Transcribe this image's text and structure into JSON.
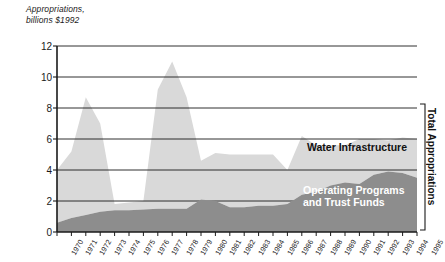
{
  "chart_data": {
    "type": "area",
    "stacked": true,
    "title": "Appropriations,\nbillions $1992",
    "xlabel": "",
    "ylabel": "Appropriations, billions $1992",
    "ylim": [
      0,
      12
    ],
    "yticks": [
      0,
      2,
      4,
      6,
      8,
      10,
      12
    ],
    "grid": true,
    "grid_axis": "y",
    "legend_position": "inline-annotation",
    "x": [
      1970,
      1971,
      1972,
      1973,
      1974,
      1975,
      1976,
      1977,
      1978,
      1979,
      1980,
      1981,
      1982,
      1983,
      1984,
      1985,
      1986,
      1987,
      1988,
      1989,
      1990,
      1991,
      1992,
      1993,
      1994,
      1995
    ],
    "categories": [
      "1970",
      "1971",
      "1972",
      "1973",
      "1974",
      "1975",
      "1976",
      "1977",
      "1978",
      "1979",
      "1980",
      "1981",
      "1982",
      "1983",
      "1984",
      "1985",
      "1986",
      "1987",
      "1988",
      "1989",
      "1990",
      "1991",
      "1992",
      "1993",
      "1994",
      "1995"
    ],
    "series": [
      {
        "name": "Operating Programs and Trust Funds",
        "color": "#8d8d8d",
        "values": [
          0.6,
          0.9,
          1.1,
          1.3,
          1.4,
          1.4,
          1.45,
          1.5,
          1.5,
          1.5,
          2.1,
          2.0,
          1.6,
          1.6,
          1.7,
          1.7,
          1.8,
          2.4,
          2.6,
          3.0,
          3.2,
          3.1,
          3.7,
          3.9,
          3.8,
          3.5
        ]
      },
      {
        "name": "Water Infrastructure",
        "color": "#d9d9d9",
        "values": [
          3.4,
          4.3,
          7.6,
          5.7,
          0.4,
          0.5,
          0.55,
          7.7,
          9.5,
          7.2,
          2.5,
          3.1,
          3.4,
          3.4,
          3.3,
          3.3,
          2.2,
          3.8,
          3.0,
          2.6,
          2.4,
          2.9,
          2.3,
          2.0,
          2.3,
          2.5
        ]
      }
    ],
    "totals": [
      4.0,
      5.2,
      8.7,
      7.0,
      1.8,
      1.9,
      2.0,
      9.2,
      11.0,
      8.7,
      4.6,
      5.1,
      5.0,
      5.0,
      5.0,
      5.0,
      4.0,
      6.2,
      5.6,
      5.6,
      5.6,
      6.0,
      6.0,
      5.9,
      6.1,
      6.0
    ],
    "annotations": [
      {
        "name": "water-infrastructure-label",
        "text": "Water Infrastructure"
      },
      {
        "name": "operating-programs-label",
        "text": "Operating Programs\nand Trust Funds"
      },
      {
        "name": "total-appropriations-bracket",
        "text": "Total Appropriations"
      }
    ]
  },
  "axis": {
    "title": "Appropriations,\nbillions $1992",
    "yticks": [
      "0",
      "2",
      "4",
      "6",
      "8",
      "10",
      "12"
    ],
    "xticks": [
      "1970",
      "1971",
      "1972",
      "1973",
      "1974",
      "1975",
      "1976",
      "1977",
      "1978",
      "1979",
      "1980",
      "1981",
      "1982",
      "1983",
      "1984",
      "1985",
      "1986",
      "1987",
      "1988",
      "1989",
      "1990",
      "1991",
      "1992",
      "1993",
      "1994",
      "1995"
    ]
  },
  "labels": {
    "water": "Water Infrastructure",
    "operating": "Operating Programs\nand Trust Funds",
    "total_bracket": "Total Appropriations"
  },
  "colors": {
    "water_infrastructure": "#d9d9d9",
    "operating_programs": "#8d8d8d",
    "axis": "#1a1a1a",
    "grid": "#1a1a1a",
    "background": "#ffffff"
  }
}
